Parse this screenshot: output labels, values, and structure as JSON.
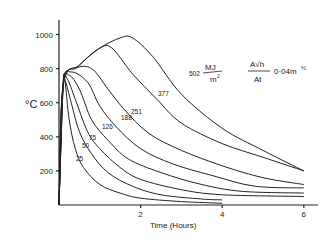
{
  "chart_data": {
    "type": "line",
    "title": "",
    "xlabel": "Time (Hours)",
    "ylabel": "°C",
    "xlim": [
      0,
      6.3
    ],
    "ylim": [
      0,
      1100
    ],
    "x_ticks": [
      "2",
      "4",
      "6"
    ],
    "y_ticks": [
      "200",
      "400",
      "600",
      "800",
      "1000"
    ],
    "grid": false,
    "legend_position": "none",
    "annotation_units": "MJ/m²",
    "parameter_label": "A√h / At  0.04 m^½",
    "series": [
      {
        "name": "25",
        "x": [
          0,
          0.1,
          0.15,
          0.25,
          0.4,
          0.6,
          1.0,
          1.5,
          2.0,
          3.0,
          4.0
        ],
        "y": [
          0,
          700,
          720,
          500,
          330,
          220,
          120,
          70,
          40,
          20,
          10
        ]
      },
      {
        "name": "50",
        "x": [
          0,
          0.1,
          0.15,
          0.3,
          0.5,
          0.8,
          1.2,
          1.8,
          2.5,
          3.5,
          4.0
        ],
        "y": [
          0,
          700,
          730,
          600,
          430,
          300,
          190,
          110,
          60,
          35,
          30
        ]
      },
      {
        "name": "75",
        "x": [
          0,
          0.1,
          0.2,
          0.4,
          0.7,
          1.0,
          1.5,
          2.0,
          3.0,
          4.0,
          6.0
        ],
        "y": [
          0,
          700,
          740,
          620,
          430,
          330,
          220,
          150,
          90,
          60,
          50
        ]
      },
      {
        "name": "126",
        "x": [
          0,
          0.1,
          0.25,
          0.5,
          0.8,
          1.2,
          1.7,
          2.5,
          3.5,
          4.5,
          6.0
        ],
        "y": [
          0,
          700,
          760,
          680,
          500,
          380,
          270,
          190,
          120,
          80,
          70
        ]
      },
      {
        "name": "188",
        "x": [
          0,
          0.1,
          0.3,
          0.7,
          1.0,
          1.4,
          2.0,
          2.8,
          3.8,
          4.8,
          6.0
        ],
        "y": [
          0,
          700,
          780,
          720,
          580,
          460,
          330,
          240,
          170,
          110,
          100
        ]
      },
      {
        "name": "251",
        "x": [
          0,
          0.1,
          0.4,
          0.8,
          1.2,
          1.6,
          2.2,
          3.0,
          4.0,
          5.0,
          6.0
        ],
        "y": [
          0,
          700,
          800,
          800,
          680,
          560,
          420,
          320,
          230,
          160,
          120
        ]
      },
      {
        "name": "377",
        "x": [
          0,
          0.1,
          0.5,
          1.0,
          1.3,
          1.8,
          2.4,
          3.0,
          4.0,
          5.0,
          6.0
        ],
        "y": [
          0,
          700,
          820,
          920,
          920,
          770,
          620,
          480,
          360,
          280,
          200
        ]
      },
      {
        "name": "502",
        "x": [
          0,
          0.1,
          0.5,
          1.0,
          1.5,
          1.8,
          2.3,
          3.0,
          4.0,
          5.0,
          6.0
        ],
        "y": [
          0,
          700,
          820,
          920,
          980,
          980,
          870,
          650,
          450,
          320,
          200
        ]
      }
    ]
  },
  "labels": {
    "y_unit": "°C",
    "x_title": "Time (Hours)",
    "mj": "MJ",
    "m2": "m",
    "sq": "2",
    "param_num": "A√h",
    "param_den": "At",
    "param_value": "0·04m",
    "param_exp": "½"
  }
}
